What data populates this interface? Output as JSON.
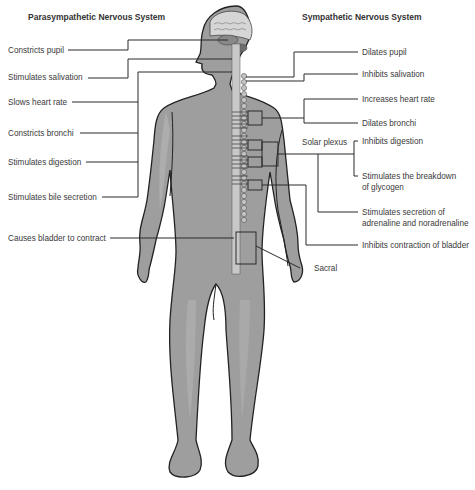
{
  "titles": {
    "left": "Parasympathetic Nervous System",
    "right": "Sympathetic Nervous System"
  },
  "parasympathetic": [
    {
      "label": "Constricts pupil",
      "x": 8,
      "y": 45
    },
    {
      "label": "Stimulates salivation",
      "x": 8,
      "y": 72
    },
    {
      "label": "Slows heart rate",
      "x": 8,
      "y": 97
    },
    {
      "label": "Constricts bronchi",
      "x": 8,
      "y": 128
    },
    {
      "label": "Stimulates digestion",
      "x": 8,
      "y": 157
    },
    {
      "label": "Stimulates bile secretion",
      "x": 8,
      "y": 192
    },
    {
      "label": "Causes bladder to contract",
      "x": 8,
      "y": 233
    }
  ],
  "sympathetic": [
    {
      "label": "Dilates pupil",
      "x": 362,
      "y": 47
    },
    {
      "label": "Inhibits salivation",
      "x": 362,
      "y": 69
    },
    {
      "label": "Increases heart rate",
      "x": 362,
      "y": 94
    },
    {
      "label": "Dilates bronchi",
      "x": 362,
      "y": 118
    },
    {
      "label": "Inhibits digestion",
      "x": 362,
      "y": 136
    },
    {
      "label": "Stimulates the breakdown",
      "x": 362,
      "y": 171
    },
    {
      "label": "of glycogen",
      "x": 362,
      "y": 182
    },
    {
      "label": "Stimulates secretion of",
      "x": 362,
      "y": 207
    },
    {
      "label": "adrenaline and noradrenaline",
      "x": 362,
      "y": 218
    },
    {
      "label": "Inhibits contraction of bladder",
      "x": 362,
      "y": 240
    }
  ],
  "annotations": {
    "solar_plexus": "Solar plexus",
    "sacral": "Sacral"
  },
  "colors": {
    "body_fill": "#9e9e9e",
    "body_highlight": "#b4b4b4",
    "outline": "#222222",
    "line": "#2a2a2a"
  }
}
